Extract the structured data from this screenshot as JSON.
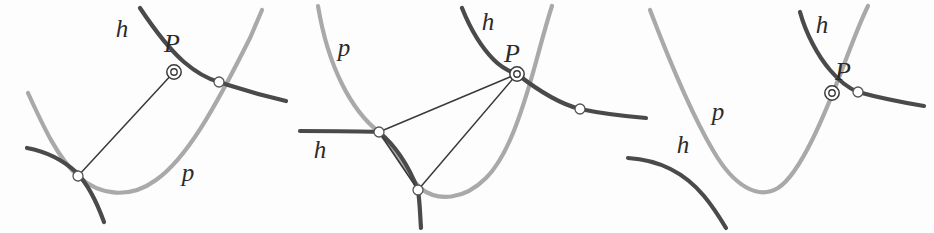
{
  "figure": {
    "background_color": "#fdfdfd",
    "width": 934,
    "height": 233,
    "panel_count": 3
  },
  "colors": {
    "parabola": "#a9a9a9",
    "hyperbola": "#4a4a4a",
    "chord": "#3a3a3a",
    "marker_fill": "#ffffff",
    "marker_stroke": "#555555",
    "label": "#2b2b2b",
    "background": "#fdfdfd"
  },
  "labels": {
    "h": "h",
    "p": "p",
    "P": "P"
  },
  "panels": [
    {
      "id": "panel-1",
      "name": "panel-left",
      "labels": [
        {
          "text": "h",
          "x": 122,
          "y": 37,
          "name": "label-h-top"
        },
        {
          "text": "P",
          "x": 172,
          "y": 52,
          "name": "label-P"
        },
        {
          "text": "p",
          "x": 188,
          "y": 181,
          "name": "label-p"
        }
      ],
      "vertex_count": 3,
      "chord_count": 1,
      "marked_point": "P"
    },
    {
      "id": "panel-2",
      "name": "panel-middle",
      "labels": [
        {
          "text": "p",
          "x": 344,
          "y": 56,
          "name": "label-p"
        },
        {
          "text": "h",
          "x": 488,
          "y": 30,
          "name": "label-h-top"
        },
        {
          "text": "P",
          "x": 512,
          "y": 62,
          "name": "label-P"
        },
        {
          "text": "h",
          "x": 320,
          "y": 158,
          "name": "label-h-left"
        }
      ],
      "vertex_count": 4,
      "chord_count": 3,
      "marked_point": "P"
    },
    {
      "id": "panel-3",
      "name": "panel-right",
      "labels": [
        {
          "text": "h",
          "x": 822,
          "y": 33,
          "name": "label-h-top"
        },
        {
          "text": "P",
          "x": 843,
          "y": 80,
          "name": "label-P"
        },
        {
          "text": "p",
          "x": 718,
          "y": 120,
          "name": "label-p"
        },
        {
          "text": "h",
          "x": 683,
          "y": 153,
          "name": "label-h-left"
        }
      ],
      "vertex_count": 1,
      "chord_count": 0,
      "marked_point": "P"
    }
  ],
  "curves": {
    "panel1": {
      "parabola": "M 28,93 C 44,128 58,158 78,176 C 100,196 130,199 156,180 C 186,159 214,110 250,38 L 262,10",
      "hyperbola_upper": "M 140,8 C 152,26 168,48 184,62 C 198,74 208,79 219,82",
      "hyperbola_right": "M 219,82 C 238,88 252,93 286,101",
      "hyperbola_lower_left": "M 27,148 C 48,152 64,161 76,172",
      "hyperbola_lower_down": "M 76,172 C 88,184 96,200 104,222",
      "chord": "M 78,176 L 174,72"
    },
    "panel2": {
      "parabola_left": "M 318,6 C 322,30 330,60 342,84 C 354,108 366,122 379,132",
      "parabola_mid": "M 379,132 C 392,146 402,168 420,188 C 438,202 464,200 486,178 C 506,158 520,120 536,62 C 543,36 548,18 552,6",
      "hyperbola_top": "M 462,8 C 470,28 482,48 494,60 C 502,68 508,71 517,74",
      "hyperbola_right_arc": "M 517,74 C 540,92 560,104 580,109",
      "hyperbola_right_out": "M 580,109 C 604,114 622,116 646,118",
      "hyperbola_left_in": "M 300,131 C 330,131 358,131 379,132",
      "hyperbola_left_arc": "M 379,132 C 396,146 408,164 418,190",
      "hyperbola_bottom_tail": "M 418,190 C 420,204 420,214 421,228",
      "chord_P_left": "M 517,74 L 379,132",
      "chord_P_bottom": "M 517,74 L 418,190",
      "chord_left_bottom": "M 379,132 L 418,190"
    },
    "panel3": {
      "parabola": "M 650,10 C 666,52 690,112 714,152 C 734,186 758,200 778,188 C 800,174 824,118 848,54 C 858,28 864,14 868,6",
      "hyperbola_top": "M 800,12 C 806,34 818,56 830,70 C 840,82 848,88 858,92",
      "hyperbola_right": "M 858,92 C 880,98 900,102 924,106",
      "hyperbola_left_detached": "M 628,158 C 660,160 684,172 704,196 C 714,208 720,218 726,228"
    }
  },
  "markers": {
    "panel1": [
      {
        "name": "point-P",
        "x": 174,
        "y": 72,
        "type": "double-ring"
      },
      {
        "name": "vertex-right",
        "x": 219,
        "y": 82,
        "type": "circle"
      },
      {
        "name": "vertex-bottom-left",
        "x": 78,
        "y": 176,
        "type": "circle"
      }
    ],
    "panel2": [
      {
        "name": "point-P",
        "x": 517,
        "y": 74,
        "type": "double-ring"
      },
      {
        "name": "vertex-right",
        "x": 580,
        "y": 109,
        "type": "circle"
      },
      {
        "name": "vertex-left",
        "x": 379,
        "y": 132,
        "type": "circle"
      },
      {
        "name": "vertex-bottom",
        "x": 418,
        "y": 190,
        "type": "circle"
      }
    ],
    "panel3": [
      {
        "name": "point-P",
        "x": 832,
        "y": 93,
        "type": "double-ring"
      },
      {
        "name": "vertex-intersection",
        "x": 858,
        "y": 92,
        "type": "circle"
      }
    ]
  }
}
